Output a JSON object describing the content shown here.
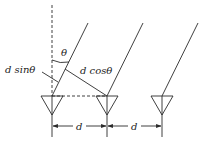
{
  "diagram": {
    "type": "uniform linear antenna array geometry",
    "labels": {
      "theta": "θ",
      "d_sin": "d sinθ",
      "d_cos": "d cosθ",
      "spacing_1": "d",
      "spacing_2": "d"
    },
    "elements": [
      {
        "id": "antenna-1",
        "x": 52
      },
      {
        "id": "antenna-2",
        "x": 107
      },
      {
        "id": "antenna-3",
        "x": 162
      }
    ],
    "colors": {
      "line": "#2a2a2a",
      "text": "#222222",
      "background": "#ffffff"
    }
  }
}
